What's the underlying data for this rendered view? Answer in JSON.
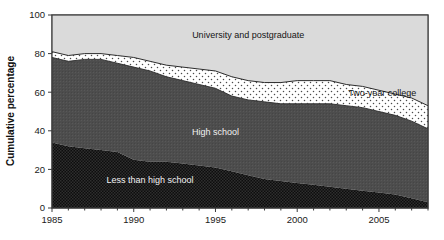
{
  "chart_data": {
    "type": "area",
    "title": "",
    "subtitle": "",
    "xlabel": "",
    "ylabel": "Cumulative percentage",
    "xlim": [
      1985,
      2008
    ],
    "ylim": [
      0,
      100
    ],
    "grid": false,
    "legend_position": "inline-labels",
    "stacked": true,
    "x": [
      1985,
      1986,
      1987,
      1988,
      1989,
      1990,
      1991,
      1992,
      1993,
      1994,
      1995,
      1996,
      1997,
      1998,
      1999,
      2000,
      2001,
      2002,
      2003,
      2004,
      2005,
      2006,
      2007,
      2008
    ],
    "xticks": [
      "1985",
      "1990",
      "1995",
      "2000",
      "2005"
    ],
    "xtick_values": [
      1985,
      1990,
      1995,
      2000,
      2005
    ],
    "yticks": [
      "0",
      "20",
      "40",
      "60",
      "80",
      "100"
    ],
    "ytick_values": [
      0,
      20,
      40,
      60,
      80,
      100
    ],
    "series": [
      {
        "name": "Less than high school",
        "fill": "#111111",
        "pattern": "dense-dots",
        "label_color": "#f2f2f2",
        "values": [
          34,
          32,
          31,
          30,
          29,
          25,
          24,
          24,
          23,
          22,
          21,
          19,
          17,
          15,
          14,
          13,
          12,
          11,
          10,
          9,
          8,
          7,
          5,
          3
        ]
      },
      {
        "name": "High school",
        "fill": "#4a4a4a",
        "pattern": "solid-gray",
        "label_color": "#f2f2f2",
        "values": [
          44,
          44,
          46,
          47,
          46,
          48,
          47,
          44,
          43,
          42,
          41,
          39,
          39,
          40,
          40,
          41,
          42,
          43,
          43,
          43,
          42,
          41,
          40,
          38
        ]
      },
      {
        "name": "Two-year college",
        "fill": "#ffffff",
        "pattern": "sparse-dots",
        "label_color": "#141414",
        "values": [
          3,
          3,
          3,
          3,
          4,
          5,
          5,
          6,
          7,
          8,
          9,
          10,
          10,
          10,
          11,
          12,
          12,
          12,
          11,
          11,
          11,
          11,
          12,
          12
        ]
      },
      {
        "name": "University and postgraduate",
        "fill": "#d9d9d9",
        "pattern": "plain",
        "label_color": "#141414",
        "values": [
          19,
          21,
          20,
          20,
          21,
          17,
          18,
          20,
          21,
          21,
          22,
          24,
          25,
          26,
          26,
          26,
          26,
          26,
          29,
          30,
          31,
          33,
          35,
          37
        ]
      }
    ],
    "cumulative_tops": {
      "less_than_high_school": [
        34,
        32,
        31,
        30,
        29,
        25,
        24,
        24,
        23,
        22,
        21,
        19,
        17,
        15,
        14,
        13,
        12,
        11,
        10,
        9,
        8,
        7,
        5,
        3
      ],
      "high_school": [
        78,
        76,
        77,
        77,
        75,
        73,
        71,
        68,
        66,
        64,
        62,
        58,
        56,
        55,
        54,
        54,
        54,
        54,
        53,
        52,
        50,
        48,
        45,
        41
      ],
      "two_year_college": [
        81,
        79,
        80,
        80,
        79,
        78,
        76,
        74,
        73,
        72,
        71,
        68,
        66,
        65,
        65,
        66,
        66,
        66,
        64,
        63,
        61,
        59,
        57,
        53
      ],
      "university_and_postgraduate": [
        100,
        100,
        100,
        100,
        100,
        100,
        100,
        100,
        100,
        100,
        100,
        100,
        100,
        100,
        100,
        100,
        100,
        100,
        100,
        100,
        100,
        100,
        100,
        100
      ]
    },
    "annotations": [
      {
        "text": "University and postgraduate",
        "x": 1997.0,
        "y": 88,
        "color": "#141414"
      },
      {
        "text": "Two-year college",
        "x": 2005.2,
        "y": 58,
        "color": "#141414"
      },
      {
        "text": "High school",
        "x": 1995.0,
        "y": 38,
        "color": "#f2f2f2"
      },
      {
        "text": "Less than high school",
        "x": 1991.0,
        "y": 13,
        "color": "#f2f2f2"
      }
    ]
  },
  "axes": {
    "y_title": "Cumulative percentage",
    "x_tick_labels": [
      "1985",
      "1990",
      "1995",
      "2000",
      "2005"
    ],
    "y_tick_labels": [
      "100",
      "80",
      "60",
      "40",
      "20",
      "0"
    ]
  },
  "colors": {
    "less_than_high_school": "#111111",
    "high_school": "#4a4a4a",
    "two_year_college": "#ffffff",
    "university_and_postgraduate": "#d9d9d9",
    "axis": "#3b3b3b",
    "background": "#ffffff"
  }
}
